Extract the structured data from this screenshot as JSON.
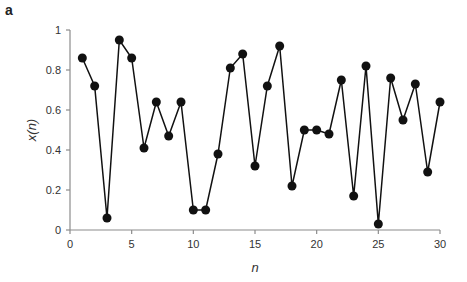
{
  "panel_label": "a",
  "chart_data": {
    "type": "line",
    "title": "",
    "xlabel": "n",
    "ylabel": "x(n)",
    "x": [
      1,
      2,
      3,
      4,
      5,
      6,
      7,
      8,
      9,
      10,
      11,
      12,
      13,
      14,
      15,
      16,
      17,
      18,
      19,
      20,
      21,
      22,
      23,
      24,
      25,
      26,
      27,
      28,
      29,
      30
    ],
    "series": [
      {
        "name": "x(n)",
        "values": [
          0.86,
          0.72,
          0.06,
          0.95,
          0.86,
          0.41,
          0.64,
          0.47,
          0.64,
          0.1,
          0.1,
          0.38,
          0.81,
          0.88,
          0.32,
          0.72,
          0.92,
          0.22,
          0.5,
          0.5,
          0.48,
          0.75,
          0.17,
          0.82,
          0.03,
          0.76,
          0.55,
          0.73,
          0.29,
          0.64
        ],
        "color": "#111111",
        "marker": "circle"
      }
    ],
    "xlim": [
      0,
      30
    ],
    "ylim": [
      0,
      1
    ],
    "xticks": [
      "0",
      "5",
      "10",
      "15",
      "20",
      "25",
      "30"
    ],
    "yticks": [
      "0",
      "0.2",
      "0.4",
      "0.6",
      "0.8",
      "1"
    ],
    "grid": false,
    "legend": "none"
  }
}
